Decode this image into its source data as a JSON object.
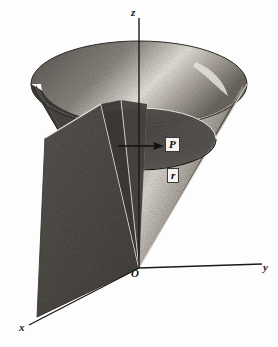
{
  "figure": {
    "kind": "3d-math-diagram",
    "background_color": "#fdfdfd",
    "ink_color": "#1a1a1a",
    "surface_dark_color": "#4a4744",
    "surface_mid_color": "#6f6a66",
    "surface_light_color": "#c9c4bd",
    "highlight_color": "#efece6",
    "axes": [
      {
        "name": "z-axis",
        "label": "z",
        "direction": "up"
      },
      {
        "name": "y-axis",
        "label": "y",
        "direction": "right"
      },
      {
        "name": "x-axis",
        "label": "x",
        "direction": "lower-left"
      }
    ],
    "labels": {
      "origin": "O",
      "point": "P",
      "radius": "r",
      "z": "z",
      "y": "y",
      "x": "x"
    },
    "elements": [
      {
        "name": "cone-surface",
        "label": "cone"
      },
      {
        "name": "half-plane",
        "label": "half-plane"
      },
      {
        "name": "inner-circle",
        "label": "circle through P"
      },
      {
        "name": "radius-arrow",
        "label": "r"
      }
    ],
    "caption": ""
  }
}
